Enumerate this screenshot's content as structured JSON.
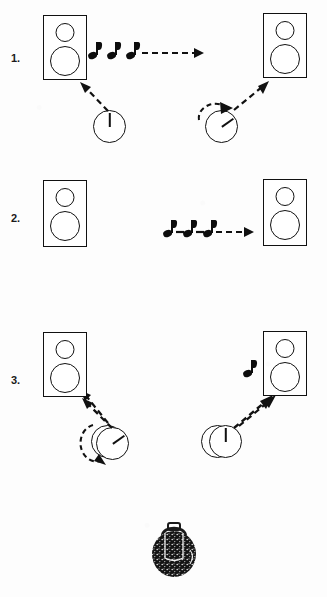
{
  "page": {
    "background_color": "#fdfdfd",
    "ink_color": "#111111",
    "width": 327,
    "height": 597
  },
  "exercises": [
    {
      "number": "1.",
      "left_speaker": {
        "icon": "speaker-icon",
        "tweeter": "tweeter-circle",
        "woofer": "woofer-circle"
      },
      "right_speaker": {
        "icon": "speaker-icon",
        "tweeter": "tweeter-circle",
        "woofer": "woofer-circle"
      },
      "notes": {
        "icon": "eighth-note-icon",
        "count": 3,
        "position": "left-of-arrow"
      },
      "sound_arrow": {
        "icon": "dashed-arrow-right-icon",
        "direction": "right"
      },
      "left_dial": {
        "icon": "volume-knob-icon",
        "hand_position": "12-o-clock",
        "rotation_hint": "none"
      },
      "right_dial": {
        "icon": "volume-knob-icon",
        "hand_position": "7-o-clock",
        "rotation_hint": "counter-clockwise"
      },
      "left_connector": {
        "icon": "dashed-arrow-up-left-icon"
      },
      "right_connector": {
        "icon": "dashed-arrow-up-right-icon"
      }
    },
    {
      "number": "2.",
      "left_speaker": {
        "icon": "speaker-icon",
        "tweeter": "tweeter-circle",
        "woofer": "woofer-circle"
      },
      "right_speaker": {
        "icon": "speaker-icon",
        "tweeter": "tweeter-circle",
        "woofer": "woofer-circle"
      },
      "notes": {
        "icon": "eighth-note-icon",
        "count": 3,
        "position": "between-dials"
      },
      "sound_arrow": {
        "icon": "dashed-arrow-right-icon",
        "direction": "right"
      },
      "left_dial": {
        "icon": "volume-knob-icon",
        "hand_position": "12-o-clock",
        "rotation_hint": "counter-clockwise"
      },
      "right_dial": {
        "icon": "volume-knob-icon",
        "hand_position": "12-o-clock",
        "rotation_hint": "none"
      },
      "left_connector": {
        "icon": "dashed-arrow-up-left-icon"
      },
      "right_connector": {
        "icon": "dashed-arrow-up-right-icon"
      }
    },
    {
      "number": "3.",
      "left_speaker": {
        "icon": "speaker-icon",
        "tweeter": "tweeter-circle",
        "woofer": "woofer-circle"
      },
      "right_speaker": {
        "icon": "speaker-icon",
        "tweeter": "tweeter-circle",
        "woofer": "woofer-circle"
      },
      "notes": {
        "icon": "eighth-note-icon",
        "count": 1,
        "position": "left-of-right-speaker"
      },
      "sound_arrow": {
        "icon": "none",
        "direction": "none"
      },
      "left_dial": {
        "icon": "volume-knob-icon",
        "hand_position": "7-o-clock",
        "rotation_hint": "none"
      },
      "right_dial": {
        "icon": "volume-knob-icon",
        "hand_position": "12-o-clock",
        "rotation_hint": "none"
      },
      "left_connector": {
        "icon": "dashed-arrow-up-left-icon"
      },
      "right_connector": {
        "icon": "dashed-arrow-up-right-icon"
      }
    }
  ],
  "footer": {
    "illustration": {
      "icon": "backpack-icon",
      "name": "backpack"
    }
  }
}
